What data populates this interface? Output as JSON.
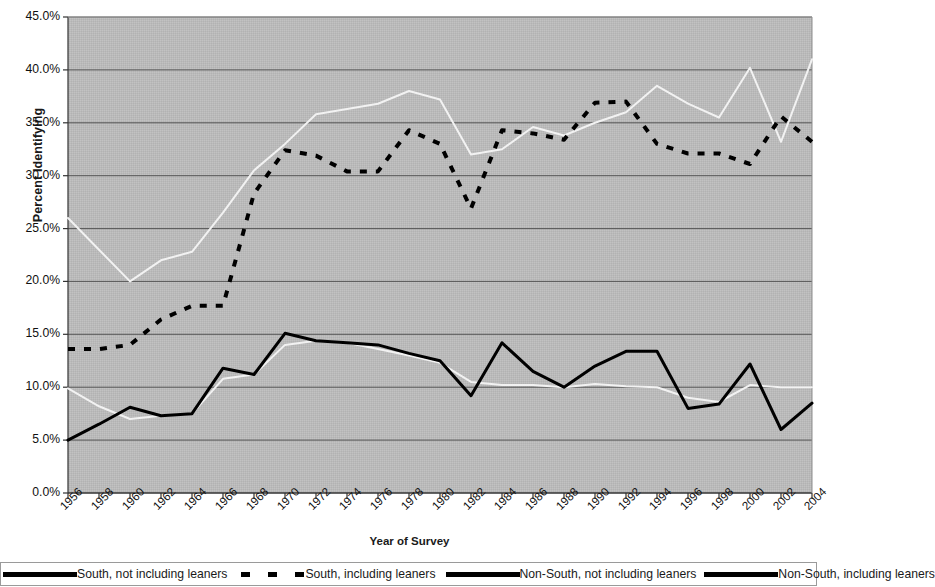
{
  "chart_data": {
    "type": "line",
    "title": "",
    "xlabel": "Year of Survey",
    "ylabel": "Percent Identifying",
    "grid": true,
    "legend_position": "bottom",
    "plot_background": "#b9b9b9",
    "xlim": [
      1956,
      2004
    ],
    "ylim": [
      0.0,
      45.0
    ],
    "ytick_labels": [
      "45.0%",
      "40.0%",
      "35.0%",
      "30.0%",
      "25.0%",
      "20.0%",
      "15.0%",
      "10.0%",
      "5.0%",
      "0.0%"
    ],
    "ytick_values": [
      45.0,
      40.0,
      35.0,
      30.0,
      25.0,
      20.0,
      15.0,
      10.0,
      5.0,
      0.0
    ],
    "xtick_labels": [
      "1956",
      "1958",
      "1960",
      "1962",
      "1964",
      "1966",
      "1968",
      "1970",
      "1972",
      "1974",
      "1976",
      "1978",
      "1980",
      "1982",
      "1984",
      "1986",
      "1988",
      "1990",
      "1992",
      "1994",
      "1996",
      "1998",
      "2000",
      "2002",
      "2004"
    ],
    "xtick_values": [
      1956,
      1958,
      1960,
      1962,
      1964,
      1966,
      1968,
      1970,
      1972,
      1974,
      1976,
      1978,
      1980,
      1982,
      1984,
      1986,
      1988,
      1990,
      1992,
      1994,
      1996,
      1998,
      2000,
      2002,
      2004
    ],
    "series": [
      {
        "name": "South, not including leaners",
        "style": "solid",
        "color": "#f2f2f2",
        "width": 2,
        "x": [
          1956,
          1958,
          1960,
          1962,
          1964,
          1966,
          1968,
          1970,
          1972,
          1974,
          1976,
          1978,
          1980,
          1982,
          1984,
          1986,
          1988,
          1990,
          1992,
          1994,
          1996,
          1998,
          2000,
          2002,
          2004
        ],
        "values": [
          26.0,
          23.0,
          20.0,
          22.0,
          22.8,
          26.5,
          30.5,
          33.0,
          35.8,
          36.3,
          36.8,
          38.0,
          37.2,
          32.0,
          32.5,
          34.6,
          33.8,
          35.0,
          36.0,
          38.5,
          36.8,
          35.5,
          40.2,
          33.2,
          41.0
        ]
      },
      {
        "name": "South, including leaners",
        "style": "dashed",
        "color": "#000000",
        "width": 4,
        "x": [
          1956,
          1958,
          1960,
          1962,
          1964,
          1966,
          1968,
          1970,
          1972,
          1974,
          1976,
          1978,
          1980,
          1982,
          1984,
          1986,
          1988,
          1990,
          1992,
          1994,
          1996,
          1998,
          2000,
          2002,
          2004
        ],
        "values": [
          13.6,
          13.6,
          14.0,
          16.4,
          17.7,
          17.7,
          28.3,
          32.4,
          31.9,
          30.4,
          30.4,
          34.3,
          33.0,
          26.9,
          34.3,
          34.0,
          33.4,
          36.9,
          37.0,
          33.0,
          32.1,
          32.1,
          31.1,
          35.6,
          33.2
        ]
      },
      {
        "name": "Non-South, not including leaners",
        "style": "solid",
        "color": "#000000",
        "width": 3,
        "x": [
          1956,
          1958,
          1960,
          1962,
          1964,
          1966,
          1968,
          1970,
          1972,
          1974,
          1976,
          1978,
          1980,
          1982,
          1984,
          1986,
          1988,
          1990,
          1992,
          1994,
          1996,
          1998,
          2000,
          2002,
          2004
        ],
        "values": [
          5.0,
          6.5,
          8.1,
          7.3,
          7.5,
          11.8,
          11.2,
          15.1,
          14.4,
          14.2,
          14.0,
          13.2,
          12.5,
          9.2,
          14.2,
          11.5,
          10.0,
          12.0,
          13.4,
          13.4,
          8.0,
          8.4,
          12.2,
          6.0,
          8.5
        ]
      },
      {
        "name": "Non-South, including leaners",
        "style": "solid",
        "color": "#f2f2f2",
        "width": 2,
        "x": [
          1956,
          1958,
          1960,
          1962,
          1964,
          1966,
          1968,
          1970,
          1972,
          1974,
          1976,
          1978,
          1980,
          1982,
          1984,
          1986,
          1988,
          1990,
          1992,
          1994,
          1996,
          1998,
          2000,
          2002,
          2004
        ],
        "values": [
          9.9,
          8.2,
          7.0,
          7.3,
          7.5,
          10.8,
          11.2,
          14.0,
          14.4,
          14.2,
          13.6,
          13.0,
          12.3,
          10.5,
          10.2,
          10.2,
          10.0,
          10.3,
          10.1,
          10.0,
          9.0,
          8.6,
          10.2,
          10.0,
          10.0
        ]
      }
    ]
  },
  "axes": {
    "y_title": "Percent Identifying",
    "x_title": "Year of Survey"
  },
  "legend": {
    "entries": [
      {
        "label": "South, not including leaners",
        "style": "solid"
      },
      {
        "label": "South, including leaners",
        "style": "dashed"
      },
      {
        "label": "Non-South, not including leaners",
        "style": "solid"
      },
      {
        "label": "Non-South, including leaners",
        "style": "solid"
      }
    ]
  }
}
